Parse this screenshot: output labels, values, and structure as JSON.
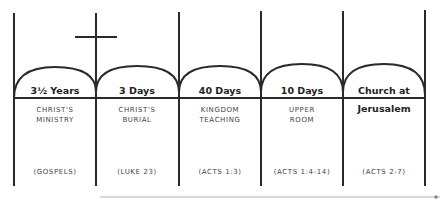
{
  "title": "PREDICTION",
  "colors": {
    "line": "#2a2a2a",
    "text": "#333333",
    "faint_line": "#bbbbbb"
  },
  "columns": [
    {
      "duration": "3½ Years",
      "label_line1": "CHRIST'S",
      "label_line2": "MINISTRY",
      "reference": "(GOSPELS)"
    },
    {
      "duration": "3 Days",
      "label_line1": "CHRIST'S",
      "label_line2": "BURIAL",
      "reference": "(LUKE 23)"
    },
    {
      "duration": "40 Days",
      "label_line1": "KINGDOM",
      "label_line2": "TEACHING",
      "reference": "(ACTS 1:3)"
    },
    {
      "duration": "10 Days",
      "label_line1": "UPPER",
      "label_line2": "ROOM",
      "reference": "(ACTS 1:4-14)"
    },
    {
      "duration": "Church at",
      "label_line1": "Jerusalem",
      "label_line2": "",
      "reference": "(ACTS 2-7)"
    }
  ],
  "icons": {
    "cross": "cross-icon"
  }
}
